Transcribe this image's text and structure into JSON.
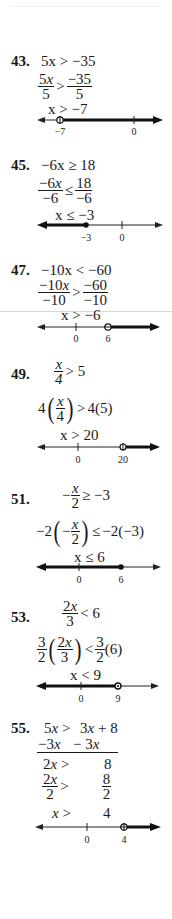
{
  "problems": [
    {
      "number": "43.",
      "steps": [
        "5x > −35",
        {
          "num_l": "5x",
          "den_l": "5",
          "rel": ">",
          "num_r": "−35",
          "den_r": "5"
        },
        "x > −7"
      ],
      "number_line": {
        "ticks": [
          {
            "label": "−7",
            "x": 60,
            "open": true
          },
          {
            "label": "0",
            "x": 134
          }
        ],
        "shade": "right",
        "endpoint": "open"
      }
    },
    {
      "number": "45.",
      "steps": [
        "−6x ≥ 18",
        {
          "num_l": "−6x",
          "den_l": "−6",
          "rel": "≤",
          "num_r": "18",
          "den_r": "−6"
        },
        "x ≤ −3"
      ],
      "number_line": {
        "ticks": [
          {
            "label": "−3",
            "x": 86
          },
          {
            "label": "0",
            "x": 122
          }
        ],
        "shade": "left",
        "endpoint": "closed"
      }
    },
    {
      "number": "47.",
      "steps": [
        "−10x < −60",
        {
          "num_l": "−10x",
          "den_l": "−10",
          "rel": ">",
          "num_r": "−60",
          "den_r": "−10"
        },
        "x > −6"
      ],
      "number_line": {
        "ticks": [
          {
            "label": "0",
            "x": 76
          },
          {
            "label": "6",
            "x": 108
          }
        ],
        "shade": "right",
        "endpoint": "open"
      }
    },
    {
      "number": "49.",
      "steps": [
        {
          "num": "x",
          "den": "4",
          "rest": "> 5"
        },
        {
          "lhs_coef": "4",
          "lhs_num": "x",
          "lhs_den": "4",
          "rel": ">",
          "rhs": "4(5)"
        },
        "x > 20"
      ],
      "number_line": {
        "ticks": [
          {
            "label": "0",
            "x": 78
          },
          {
            "label": "20",
            "x": 123
          }
        ],
        "shade": "right",
        "endpoint": "open"
      }
    },
    {
      "number": "51.",
      "steps": [
        {
          "prefix": "−",
          "num": "x",
          "den": "2",
          "rest": "≥ −3"
        },
        {
          "lhs_coef": "−2",
          "lhs_prefix": "−",
          "lhs_num": "x",
          "lhs_den": "2",
          "rel": "≤",
          "rhs": "−2(−3)"
        },
        "x ≤ 6"
      ],
      "number_line": {
        "ticks": [
          {
            "label": "0",
            "x": 79
          },
          {
            "label": "6",
            "x": 121
          }
        ],
        "shade": "left",
        "endpoint": "closed"
      }
    },
    {
      "number": "53.",
      "steps": [
        {
          "num": "2x",
          "den": "3",
          "rest": "< 6"
        },
        {
          "c_num": "3",
          "c_den": "2",
          "in_num": "2x",
          "in_den": "3",
          "rel": "<",
          "r_num": "3",
          "r_den": "2",
          "r_rest": "(6)"
        },
        "x < 9"
      ],
      "number_line": {
        "ticks": [
          {
            "label": "0",
            "x": 81
          },
          {
            "label": "9",
            "x": 118
          }
        ],
        "shade": "left",
        "endpoint": "open"
      }
    },
    {
      "number": "55.",
      "steps": {
        "line1_left": "5x >",
        "line1_right": "3x + 8",
        "line2_left": "−3x",
        "line2_right": "− 3x",
        "line3_left": "2x >",
        "line3_right": "8",
        "line4_num_l": "2x",
        "line4_den_l": "2",
        "line4_rel": ">",
        "line4_num_r": "8",
        "line4_den_r": "2",
        "line5_left": "x >",
        "line5_right": "4"
      },
      "number_line": {
        "ticks": [
          {
            "label": "0",
            "x": 87
          },
          {
            "label": "4",
            "x": 124
          }
        ],
        "shade": "right",
        "endpoint": "open"
      }
    }
  ]
}
